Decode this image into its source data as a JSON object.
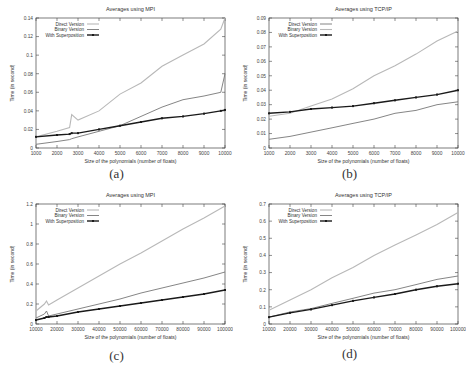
{
  "figure": {
    "legend_labels": [
      "Direct Version",
      "Binary Version",
      "With Superposition"
    ]
  },
  "chart_data": [
    {
      "id": "a",
      "caption": "(a)",
      "type": "line",
      "title": "Averages using MPI",
      "xlabel": "Size of the polynomials (number of floats)",
      "ylabel": "Time (in second)",
      "xlim": [
        1000,
        10000
      ],
      "ylim": [
        0,
        0.14
      ],
      "xticks": [
        1000,
        2000,
        3000,
        4000,
        5000,
        6000,
        7000,
        8000,
        9000,
        10000
      ],
      "yticks": [
        0,
        0.02,
        0.04,
        0.06,
        0.08,
        0.1,
        0.12,
        0.14
      ],
      "ytick_labels": [
        "0",
        "0.02",
        "0.04",
        "0.06",
        "0.08",
        "0.1",
        "0.12",
        "0.14"
      ],
      "grid": false,
      "legend_position": "top-left",
      "x": [
        1000,
        2000,
        2600,
        2700,
        3000,
        4000,
        5000,
        6000,
        7000,
        8000,
        9000,
        9800,
        10000
      ],
      "series": [
        {
          "name": "Direct Version",
          "style": "light-gray-line",
          "values": [
            0.012,
            0.018,
            0.022,
            0.036,
            0.03,
            0.04,
            0.058,
            0.07,
            0.088,
            0.1,
            0.112,
            0.128,
            0.14
          ]
        },
        {
          "name": "Binary Version",
          "style": "gray-line",
          "values": [
            0.004,
            0.007,
            0.009,
            0.01,
            0.012,
            0.018,
            0.024,
            0.034,
            0.044,
            0.052,
            0.056,
            0.06,
            0.08
          ]
        },
        {
          "name": "With Superposition",
          "style": "black-points",
          "values": [
            0.012,
            0.014,
            0.015,
            0.016,
            0.016,
            0.02,
            0.024,
            0.028,
            0.032,
            0.034,
            0.037,
            0.04,
            0.041
          ]
        }
      ]
    },
    {
      "id": "b",
      "caption": "(b)",
      "type": "line",
      "title": "Averages using TCP/IP",
      "xlabel": "Size of the polynomials (number of floats)",
      "ylabel": "Time (in second)",
      "xlim": [
        1000,
        10000
      ],
      "ylim": [
        0,
        0.09
      ],
      "xticks": [
        1000,
        2000,
        3000,
        4000,
        5000,
        6000,
        7000,
        8000,
        9000,
        10000
      ],
      "yticks": [
        0,
        0.01,
        0.02,
        0.03,
        0.04,
        0.05,
        0.06,
        0.07,
        0.08,
        0.09
      ],
      "ytick_labels": [
        "0",
        "0.01",
        "0.02",
        "0.03",
        "0.04",
        "0.05",
        "0.06",
        "0.07",
        "0.08",
        "0.09"
      ],
      "grid": false,
      "legend_position": "top-left",
      "x": [
        1000,
        2000,
        3000,
        4000,
        5000,
        6000,
        7000,
        8000,
        9000,
        10000
      ],
      "series": [
        {
          "name": "Direct Version",
          "style": "gray-line",
          "values": [
            0.006,
            0.008,
            0.011,
            0.014,
            0.017,
            0.02,
            0.024,
            0.026,
            0.03,
            0.032
          ]
        },
        {
          "name": "Binary Version",
          "style": "light-gray-line",
          "values": [
            0.022,
            0.024,
            0.029,
            0.034,
            0.041,
            0.05,
            0.057,
            0.065,
            0.074,
            0.081
          ]
        },
        {
          "name": "With Superposition",
          "style": "black-points",
          "values": [
            0.024,
            0.025,
            0.027,
            0.028,
            0.029,
            0.031,
            0.033,
            0.035,
            0.037,
            0.04
          ]
        }
      ]
    },
    {
      "id": "c",
      "caption": "(c)",
      "type": "line",
      "title": "Averages using MPI",
      "xlabel": "Size of the polynomials (number of floats)",
      "ylabel": "Time (in second)",
      "xlim": [
        10000,
        100000
      ],
      "ylim": [
        0,
        1.2
      ],
      "xticks": [
        10000,
        20000,
        30000,
        40000,
        50000,
        60000,
        70000,
        80000,
        90000,
        100000
      ],
      "yticks": [
        0,
        0.2,
        0.4,
        0.6,
        0.8,
        1,
        1.2
      ],
      "ytick_labels": [
        "0",
        "0.2",
        "0.4",
        "0.6",
        "0.8",
        "1",
        "1.2"
      ],
      "grid": false,
      "legend_position": "top-left",
      "x": [
        10000,
        14000,
        15000,
        16000,
        20000,
        30000,
        40000,
        50000,
        60000,
        70000,
        80000,
        90000,
        100000
      ],
      "series": [
        {
          "name": "Direct Version",
          "style": "light-gray-line",
          "values": [
            0.13,
            0.2,
            0.23,
            0.19,
            0.24,
            0.36,
            0.48,
            0.6,
            0.71,
            0.83,
            0.95,
            1.06,
            1.18
          ]
        },
        {
          "name": "Binary Version",
          "style": "gray-line",
          "values": [
            0.06,
            0.1,
            0.13,
            0.08,
            0.1,
            0.15,
            0.2,
            0.25,
            0.31,
            0.36,
            0.41,
            0.46,
            0.52
          ]
        },
        {
          "name": "With Superposition",
          "style": "black-points",
          "values": [
            0.04,
            0.06,
            0.07,
            0.07,
            0.08,
            0.12,
            0.15,
            0.18,
            0.21,
            0.24,
            0.27,
            0.3,
            0.34
          ]
        }
      ]
    },
    {
      "id": "d",
      "caption": "(d)",
      "type": "line",
      "title": "Averages using TCP/IP",
      "xlabel": "Size of the polynomials (number of floats)",
      "ylabel": "Time (in second)",
      "xlim": [
        10000,
        100000
      ],
      "ylim": [
        0,
        0.7
      ],
      "xticks": [
        10000,
        20000,
        30000,
        40000,
        50000,
        60000,
        70000,
        80000,
        90000,
        100000
      ],
      "yticks": [
        0,
        0.1,
        0.2,
        0.3,
        0.4,
        0.5,
        0.6,
        0.7
      ],
      "ytick_labels": [
        "0",
        "0.1",
        "0.2",
        "0.3",
        "0.4",
        "0.5",
        "0.6",
        "0.7"
      ],
      "grid": false,
      "legend_position": "top-left",
      "x": [
        10000,
        20000,
        30000,
        40000,
        50000,
        60000,
        70000,
        80000,
        90000,
        100000
      ],
      "series": [
        {
          "name": "Direct Version",
          "style": "light-gray-line",
          "values": [
            0.08,
            0.14,
            0.2,
            0.27,
            0.33,
            0.4,
            0.46,
            0.52,
            0.58,
            0.65
          ]
        },
        {
          "name": "Binary Version",
          "style": "gray-line",
          "values": [
            0.04,
            0.07,
            0.09,
            0.12,
            0.15,
            0.18,
            0.2,
            0.23,
            0.26,
            0.28
          ]
        },
        {
          "name": "With Superposition",
          "style": "black-points",
          "values": [
            0.04,
            0.065,
            0.085,
            0.11,
            0.135,
            0.155,
            0.175,
            0.2,
            0.22,
            0.235
          ]
        }
      ]
    }
  ]
}
